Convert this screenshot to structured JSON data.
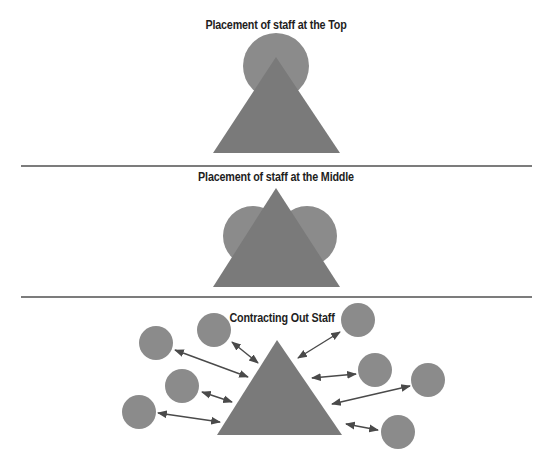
{
  "diagram": {
    "colors": {
      "background": "#ffffff",
      "circle": "#8b8b8b",
      "triangle": "#7a7a7a",
      "arrow": "#4a4a4a",
      "divider": "#7c7c7c",
      "title_text": "#1e1e1e"
    },
    "panels": [
      {
        "title": "Placement of staff at the Top",
        "description": "Single staff circle sitting at the apex of the organization triangle"
      },
      {
        "title": "Placement of staff at the Middle",
        "description": "Two staff circles at the middle on both sides of the organization triangle"
      },
      {
        "title": "Contracting Out Staff",
        "description": "Eight external staff circles connected to the organization triangle by double-headed arrows"
      }
    ]
  }
}
